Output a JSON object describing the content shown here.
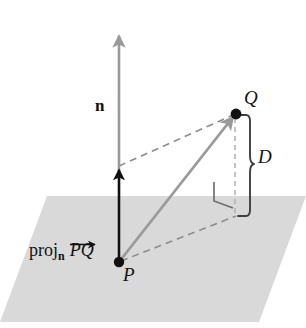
{
  "figure": {
    "type": "geometry-diagram",
    "background_color": "#ffffff",
    "plane": {
      "name": "plane",
      "fill_color": "#d9d9d9",
      "corners": "parallelogram"
    },
    "colors": {
      "plane_fill": "#d9d9d9",
      "normal_vector": "#9a9a9a",
      "pq_vector": "#9a9a9a",
      "projection_vector": "#111111",
      "dashed_line": "#8c8c8c",
      "brace": "#3f3f3f",
      "point": "#111111",
      "label_text": "#111111"
    },
    "labels": {
      "normal": "n",
      "point_p": "P",
      "point_q": "Q",
      "distance": "D",
      "projection_word": "proj",
      "projection_subscript": "n",
      "projection_vector": "PQ"
    },
    "points": [
      {
        "name": "P",
        "label": "P",
        "x": 119,
        "y": 262
      },
      {
        "name": "Q",
        "label": "Q",
        "x": 235,
        "y": 114
      }
    ],
    "vectors": [
      {
        "name": "normal-vector",
        "label": "n",
        "style": "solid",
        "color": "#9a9a9a",
        "from": [
          119,
          262
        ],
        "to": [
          119,
          31
        ]
      },
      {
        "name": "pq-vector",
        "label": "PQ",
        "style": "solid",
        "color": "#9a9a9a",
        "from": [
          119,
          262
        ],
        "to": [
          235,
          114
        ]
      },
      {
        "name": "projection-vector",
        "label": "proj n PQ",
        "style": "solid",
        "color": "#111111",
        "from": [
          119,
          262
        ],
        "to": [
          119,
          166
        ]
      }
    ],
    "dashed_segments": [
      {
        "name": "dashed-normal-to-q",
        "from": [
          119,
          166
        ],
        "to": [
          235,
          114
        ]
      },
      {
        "name": "dashed-p-to-foot",
        "from": [
          119,
          262
        ],
        "to": [
          235,
          216
        ]
      },
      {
        "name": "dashed-q-to-foot",
        "from": [
          235,
          114
        ],
        "to": [
          235,
          216
        ]
      }
    ],
    "brace": {
      "name": "distance-brace",
      "label": "D",
      "top": 114,
      "bottom": 216,
      "x": 248
    },
    "right_angle": {
      "name": "right-angle-marker",
      "x": 216,
      "y": 197
    }
  }
}
